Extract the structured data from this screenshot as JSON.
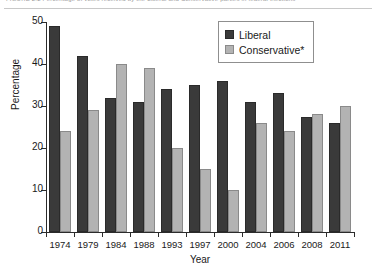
{
  "caption": {
    "text": "FIGURE 2.2   Percentage of votes received by the Liberal and Conservative parties in federal elections"
  },
  "chart_data": {
    "type": "bar",
    "title": "",
    "xlabel": "Year",
    "ylabel": "Percentage",
    "categories": [
      "1974",
      "1979",
      "1984",
      "1988",
      "1993",
      "1997",
      "2000",
      "2004",
      "2006",
      "2008",
      "2011"
    ],
    "series": [
      {
        "name": "Liberal",
        "color": "#3a3a3a",
        "values": [
          49,
          42,
          32,
          31,
          34,
          35,
          36,
          31,
          33,
          27.5,
          26
        ]
      },
      {
        "name": "Conservative*",
        "color": "#b3b3b3",
        "values": [
          24,
          29,
          40,
          39,
          20,
          15,
          10,
          26,
          24,
          28,
          30
        ]
      }
    ],
    "ylim": [
      0,
      50
    ],
    "y_ticks": [
      0,
      10,
      20,
      30,
      40,
      50
    ],
    "grid": false,
    "legend_position": "top-right"
  },
  "legend": {
    "items": [
      {
        "label": "Liberal",
        "color": "#3a3a3a"
      },
      {
        "label": "Conservative*",
        "color": "#b3b3b3"
      }
    ]
  }
}
